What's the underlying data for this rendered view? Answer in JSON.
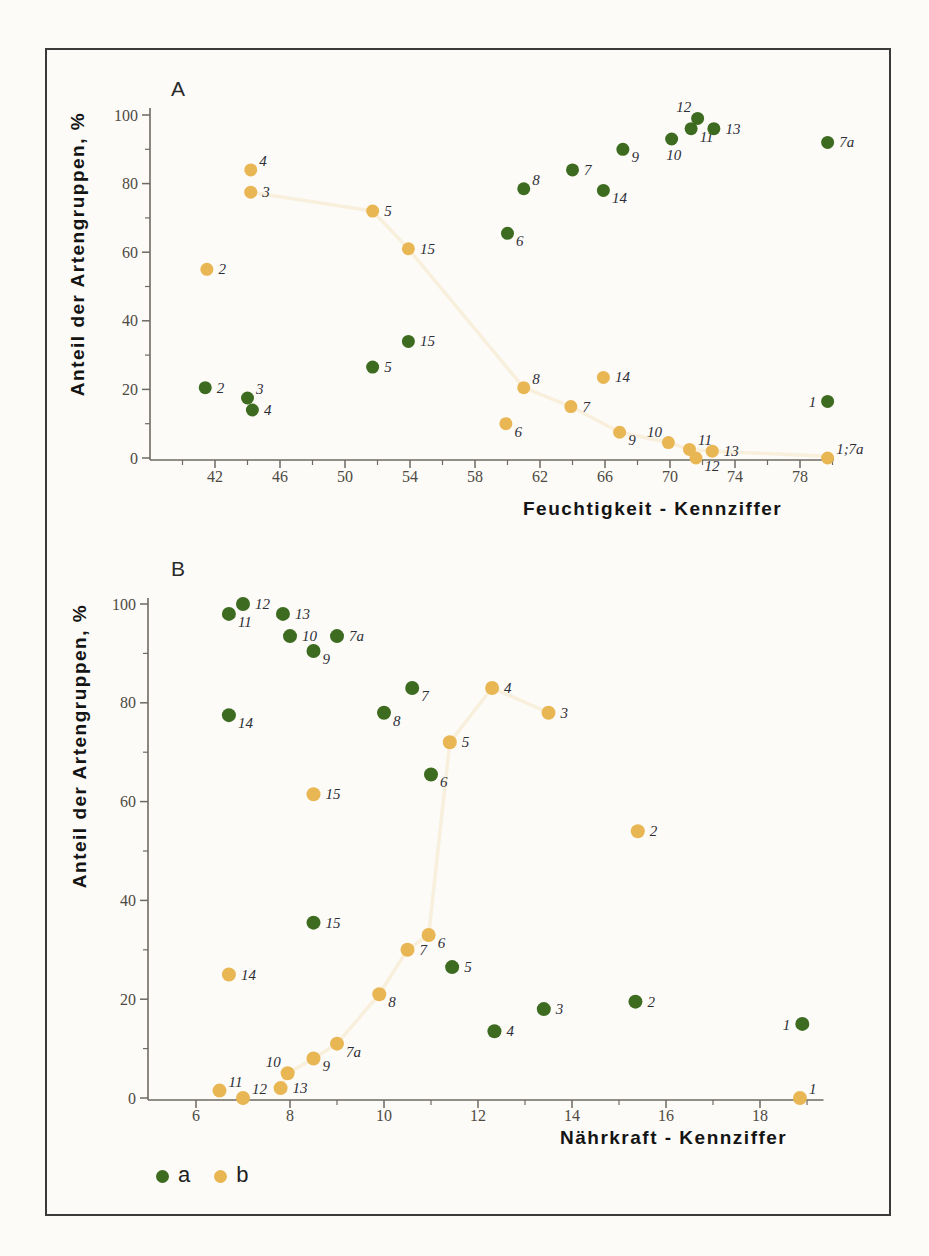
{
  "legend": {
    "items": [
      {
        "label": "a",
        "series": "a"
      },
      {
        "label": "b",
        "series": "b"
      }
    ]
  },
  "colors": {
    "series_a": "#3d6b1f",
    "series_b": "#e9b654",
    "axis": "#6e6a62",
    "tick_label": "#4e4a42",
    "point_label": "#2e2e36",
    "title": "#141414",
    "frame": "#3a3a3a",
    "paper": "#fcfbf8"
  },
  "chart_data": [
    {
      "id": "A",
      "type": "scatter",
      "panel_label": "A",
      "xlabel": "Feuchtigkeit - Kennziffer",
      "ylabel": "Anteil der Artengruppen, %",
      "xlim": [
        38,
        80.1
      ],
      "ylim": [
        0,
        100
      ],
      "x_major_ticks": [
        42,
        46,
        50,
        54,
        58,
        62,
        66,
        70,
        74,
        78
      ],
      "x_minor_ticks": [
        40,
        44,
        48,
        52,
        56,
        60,
        64,
        68,
        72,
        76,
        80
      ],
      "y_major_ticks": [
        0,
        20,
        40,
        60,
        80,
        100
      ],
      "y_minor_ticks": [
        10,
        30,
        50,
        70,
        90
      ],
      "grid": false,
      "series": [
        {
          "name": "a",
          "points": [
            {
              "label": "2",
              "x": 41.4,
              "y": 20.5,
              "lp": "r"
            },
            {
              "label": "3",
              "x": 44.0,
              "y": 17.5,
              "lp": "ar"
            },
            {
              "label": "4",
              "x": 44.3,
              "y": 14.0,
              "lp": "r"
            },
            {
              "label": "5",
              "x": 51.7,
              "y": 26.5,
              "lp": "r"
            },
            {
              "label": "15",
              "x": 53.9,
              "y": 34.0,
              "lp": "r"
            },
            {
              "label": "6",
              "x": 60.0,
              "y": 65.5,
              "lp": "br"
            },
            {
              "label": "8",
              "x": 61.0,
              "y": 78.5,
              "lp": "ar"
            },
            {
              "label": "7",
              "x": 64.0,
              "y": 84.0,
              "lp": "r"
            },
            {
              "label": "14",
              "x": 65.9,
              "y": 78.0,
              "lp": "br"
            },
            {
              "label": "9",
              "x": 67.1,
              "y": 90.0,
              "lp": "br"
            },
            {
              "label": "10",
              "x": 70.1,
              "y": 93.0,
              "lp": "b"
            },
            {
              "label": "11",
              "x": 71.3,
              "y": 96.0,
              "lp": "br"
            },
            {
              "label": "12",
              "x": 71.7,
              "y": 99.0,
              "lp": "al"
            },
            {
              "label": "13",
              "x": 72.7,
              "y": 96.0,
              "lp": "r"
            },
            {
              "label": "7a",
              "x": 79.7,
              "y": 92.0,
              "lp": "r"
            },
            {
              "label": "1",
              "x": 79.7,
              "y": 16.5,
              "lp": "l"
            }
          ]
        },
        {
          "name": "b",
          "points": [
            {
              "label": "2",
              "x": 41.5,
              "y": 55.0,
              "lp": "r"
            },
            {
              "label": "3",
              "x": 44.2,
              "y": 77.5,
              "lp": "r"
            },
            {
              "label": "4",
              "x": 44.2,
              "y": 84.0,
              "lp": "ar"
            },
            {
              "label": "5",
              "x": 51.7,
              "y": 72.0,
              "lp": "r"
            },
            {
              "label": "15",
              "x": 53.9,
              "y": 61.0,
              "lp": "r"
            },
            {
              "label": "6",
              "x": 59.9,
              "y": 10.0,
              "lp": "br"
            },
            {
              "label": "8",
              "x": 61.0,
              "y": 20.5,
              "lp": "ar"
            },
            {
              "label": "7",
              "x": 63.9,
              "y": 15.0,
              "lp": "r"
            },
            {
              "label": "14",
              "x": 65.9,
              "y": 23.5,
              "lp": "r"
            },
            {
              "label": "9",
              "x": 66.9,
              "y": 7.5,
              "lp": "br"
            },
            {
              "label": "10",
              "x": 69.9,
              "y": 4.5,
              "lp": "al"
            },
            {
              "label": "11",
              "x": 71.2,
              "y": 2.5,
              "lp": "ar"
            },
            {
              "label": "12",
              "x": 71.6,
              "y": 0.0,
              "lp": "br"
            },
            {
              "label": "13",
              "x": 72.6,
              "y": 2.0,
              "lp": "r"
            },
            {
              "label": "1;7a",
              "x": 79.7,
              "y": 0.0,
              "lp": "ar"
            }
          ],
          "trend": [
            [
              44.2,
              77.5
            ],
            [
              51.7,
              72
            ],
            [
              53.9,
              61
            ],
            [
              61,
              20.5
            ],
            [
              63.9,
              15
            ],
            [
              66.9,
              7.5
            ],
            [
              69.9,
              4.5
            ],
            [
              71.2,
              2.5
            ],
            [
              72.6,
              2
            ],
            [
              79.7,
              0.5
            ]
          ]
        }
      ]
    },
    {
      "id": "B",
      "type": "scatter",
      "panel_label": "B",
      "xlabel": "Nährkraft - Kennziffer",
      "ylabel": "Anteil der Artengruppen, %",
      "xlim": [
        5,
        19.35
      ],
      "ylim": [
        0,
        100
      ],
      "x_major_ticks": [
        6,
        8,
        10,
        12,
        14,
        16,
        18
      ],
      "x_minor_ticks": [
        7,
        9,
        11,
        13,
        15,
        17,
        19
      ],
      "y_major_ticks": [
        0,
        20,
        40,
        60,
        80,
        100
      ],
      "y_minor_ticks": [
        10,
        30,
        50,
        70,
        90
      ],
      "grid": false,
      "series": [
        {
          "name": "a",
          "points": [
            {
              "label": "11",
              "x": 6.7,
              "y": 98.0,
              "lp": "br"
            },
            {
              "label": "12",
              "x": 7.0,
              "y": 100.0,
              "lp": "r"
            },
            {
              "label": "13",
              "x": 7.85,
              "y": 98.0,
              "lp": "r"
            },
            {
              "label": "10",
              "x": 8.0,
              "y": 93.5,
              "lp": "r"
            },
            {
              "label": "9",
              "x": 8.5,
              "y": 90.5,
              "lp": "br"
            },
            {
              "label": "7a",
              "x": 9.0,
              "y": 93.5,
              "lp": "r"
            },
            {
              "label": "14",
              "x": 6.7,
              "y": 77.5,
              "lp": "br"
            },
            {
              "label": "8",
              "x": 10.0,
              "y": 78.0,
              "lp": "br"
            },
            {
              "label": "7",
              "x": 10.6,
              "y": 83.0,
              "lp": "br"
            },
            {
              "label": "6",
              "x": 11.0,
              "y": 65.5,
              "lp": "br"
            },
            {
              "label": "15",
              "x": 8.5,
              "y": 35.5,
              "lp": "r"
            },
            {
              "label": "5",
              "x": 11.45,
              "y": 26.5,
              "lp": "r"
            },
            {
              "label": "4",
              "x": 12.35,
              "y": 13.5,
              "lp": "r"
            },
            {
              "label": "3",
              "x": 13.4,
              "y": 18.0,
              "lp": "r"
            },
            {
              "label": "2",
              "x": 15.35,
              "y": 19.5,
              "lp": "r"
            },
            {
              "label": "1",
              "x": 18.9,
              "y": 15.0,
              "lp": "l"
            }
          ]
        },
        {
          "name": "b",
          "points": [
            {
              "label": "14",
              "x": 6.7,
              "y": 25.0,
              "lp": "r"
            },
            {
              "label": "11",
              "x": 6.5,
              "y": 1.5,
              "lp": "ar"
            },
            {
              "label": "12",
              "x": 7.0,
              "y": 0.0,
              "lp": "ar"
            },
            {
              "label": "13",
              "x": 7.8,
              "y": 2.0,
              "lp": "r"
            },
            {
              "label": "10",
              "x": 7.95,
              "y": 5.0,
              "lp": "al"
            },
            {
              "label": "9",
              "x": 8.5,
              "y": 8.0,
              "lp": "br"
            },
            {
              "label": "7a",
              "x": 9.0,
              "y": 11.0,
              "lp": "br"
            },
            {
              "label": "8",
              "x": 9.9,
              "y": 21.0,
              "lp": "br"
            },
            {
              "label": "7",
              "x": 10.5,
              "y": 30.0,
              "lp": "r"
            },
            {
              "label": "6",
              "x": 10.95,
              "y": 33.0,
              "lp": "br"
            },
            {
              "label": "15",
              "x": 8.5,
              "y": 61.5,
              "lp": "r"
            },
            {
              "label": "5",
              "x": 11.4,
              "y": 72.0,
              "lp": "r"
            },
            {
              "label": "4",
              "x": 12.3,
              "y": 83.0,
              "lp": "r"
            },
            {
              "label": "3",
              "x": 13.5,
              "y": 78.0,
              "lp": "r"
            },
            {
              "label": "2",
              "x": 15.4,
              "y": 54.0,
              "lp": "r"
            },
            {
              "label": "1",
              "x": 18.85,
              "y": 0.0,
              "lp": "ar"
            }
          ],
          "trend": [
            [
              7.8,
              2
            ],
            [
              7.95,
              5
            ],
            [
              8.5,
              8
            ],
            [
              9,
              11
            ],
            [
              9.9,
              21
            ],
            [
              10.5,
              30
            ],
            [
              10.95,
              33
            ],
            [
              11.4,
              72
            ],
            [
              12.3,
              83
            ],
            [
              13.5,
              78
            ]
          ]
        }
      ]
    }
  ]
}
